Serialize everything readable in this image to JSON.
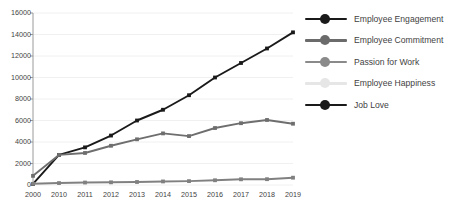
{
  "chart_data": {
    "type": "line",
    "title": "",
    "subtitle": "",
    "xlabel": "",
    "ylabel": "",
    "categories": [
      "2000",
      "2010",
      "2011",
      "2012",
      "2013",
      "2014",
      "2015",
      "2016",
      "2017",
      "2018",
      "2019"
    ],
    "ylim": [
      0,
      16000
    ],
    "ytick_values": [
      0,
      2000,
      4000,
      6000,
      8000,
      10000,
      12000,
      14000,
      16000
    ],
    "ytick_labels": [
      "0",
      "2000",
      "4000",
      "6000",
      "8000",
      "10000",
      "12000",
      "14000",
      "16000"
    ],
    "grid": true,
    "grid_axis": "y",
    "legend_position": "right",
    "marker": "square",
    "series": [
      {
        "name": "Employee Engagement",
        "color": "#1a1a1a",
        "values": [
          100,
          2800,
          3500,
          4600,
          6000,
          7000,
          8350,
          10000,
          11350,
          12700,
          14200
        ]
      },
      {
        "name": "Employee Commitment",
        "color": "#6e6e6e",
        "values": [
          850,
          2800,
          2980,
          3650,
          4250,
          4800,
          4550,
          5300,
          5750,
          6050,
          5700
        ]
      },
      {
        "name": "Passion for Work",
        "color": "#808080",
        "values": [
          110,
          180,
          230,
          250,
          280,
          330,
          360,
          440,
          530,
          540,
          680
        ]
      },
      {
        "name": "Employee Happiness",
        "color": "#e8e8e8",
        "values": [
          null,
          null,
          null,
          null,
          null,
          null,
          null,
          null,
          null,
          null,
          null
        ]
      },
      {
        "name": "Job Love",
        "color": "#1a1a1a",
        "values": [
          null,
          null,
          null,
          null,
          null,
          null,
          null,
          null,
          null,
          null,
          null
        ]
      }
    ]
  },
  "legend": {
    "items": [
      {
        "label": "Employee Engagement",
        "color": "#1a1a1a"
      },
      {
        "label": "Employee Commitment",
        "color": "#6b6b6b"
      },
      {
        "label": "Passion for Work",
        "color": "#8a8a8a"
      },
      {
        "label": "Employee Happiness",
        "color": "#e6e6e6"
      },
      {
        "label": "Job Love",
        "color": "#1a1a1a"
      }
    ]
  },
  "axis": {
    "axis_color": "#9a9a9a",
    "grid_color": "#f0f0f0",
    "tick_text_color": "#3f3f3f"
  }
}
